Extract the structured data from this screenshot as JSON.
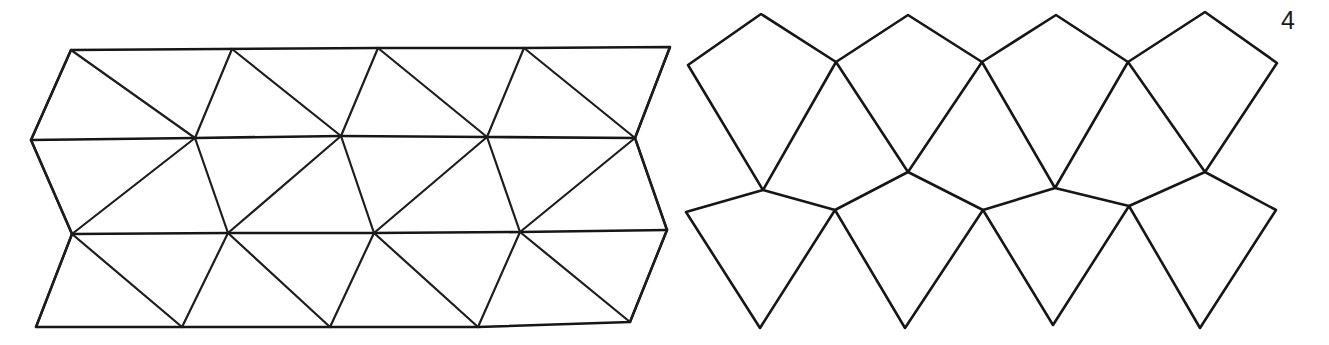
{
  "page": {
    "width": 1329,
    "height": 345,
    "background_color": "#ffffff",
    "figure_number": "4",
    "ink_color": "#161616"
  },
  "figures": [
    {
      "id": "left-net",
      "name": "triangulated-antiprism-net",
      "label": "",
      "face_type": "triangle",
      "bands": 3,
      "columns": 4,
      "bounds": {
        "x": 28,
        "y": 40,
        "width": 648,
        "height": 292
      },
      "outline_points": "71,50 378,48 524,48 670,47 635,138 667,230 630,322 478,327 330,327 182,327 36,327 72,234 31,140",
      "vertices": {
        "top_row": [
          [
            71,
            50
          ],
          [
            232,
            49
          ],
          [
            378,
            48
          ],
          [
            524,
            48
          ],
          [
            670,
            47
          ]
        ],
        "mid_upper_row": [
          [
            31,
            140
          ],
          [
            195,
            138
          ],
          [
            341,
            136
          ],
          [
            487,
            137
          ],
          [
            635,
            138
          ]
        ],
        "mid_lower_row": [
          [
            72,
            234
          ],
          [
            228,
            233
          ],
          [
            374,
            233
          ],
          [
            520,
            232
          ],
          [
            667,
            230
          ]
        ],
        "bottom_row": [
          [
            36,
            327
          ],
          [
            182,
            327
          ],
          [
            330,
            327
          ],
          [
            478,
            327
          ],
          [
            630,
            322
          ]
        ]
      },
      "edges_vertical": [
        "71,50 31,140",
        "232,49 195,138",
        "378,48 341,136",
        "524,48 487,137",
        "670,47 635,138",
        "31,140 72,234",
        "195,138 228,233",
        "341,136 374,233",
        "487,137 520,232",
        "635,138 667,230",
        "72,234 36,327",
        "228,233 182,327",
        "374,233 330,327",
        "520,232 478,327",
        "667,230 630,322"
      ],
      "edges_diagonal": [
        "71,50 195,138",
        "232,49 341,136",
        "378,48 487,137",
        "524,48 635,138",
        "195,138 72,234",
        "341,136 228,233",
        "487,137 374,233",
        "635,138 520,232",
        "72,234 182,327",
        "228,233 330,327",
        "374,233 478,327",
        "520,232 630,322"
      ]
    },
    {
      "id": "right-net",
      "name": "kite-trapezohedron-net",
      "label": "",
      "face_type": "kite",
      "rows": 2,
      "kites_per_row": 4,
      "bounds": {
        "x": 686,
        "y": 12,
        "width": 592,
        "height": 318
      },
      "upper_row_kites": [
        {
          "apex": [
            761,
            14
          ],
          "left": [
            688,
            65
          ],
          "right": [
            836,
            62
          ],
          "bottom": [
            763,
            190
          ]
        },
        {
          "apex": [
            908,
            15
          ],
          "left": [
            836,
            62
          ],
          "right": [
            982,
            62
          ],
          "bottom": [
            908,
            172
          ]
        },
        {
          "apex": [
            1056,
            15
          ],
          "left": [
            982,
            62
          ],
          "right": [
            1128,
            62
          ],
          "bottom": [
            1055,
            188
          ]
        },
        {
          "apex": [
            1205,
            12
          ],
          "left": [
            1128,
            62
          ],
          "right": [
            1277,
            63
          ],
          "bottom": [
            1205,
            172
          ]
        }
      ],
      "lower_row_kites": [
        {
          "top": [
            763,
            190
          ],
          "left": [
            686,
            212
          ],
          "right": [
            835,
            210
          ],
          "tip": [
            760,
            328
          ]
        },
        {
          "top": [
            908,
            172
          ],
          "left": [
            835,
            210
          ],
          "right": [
            983,
            210
          ],
          "tip": [
            905,
            328
          ]
        },
        {
          "top": [
            1055,
            188
          ],
          "left": [
            983,
            210
          ],
          "right": [
            1129,
            206
          ],
          "tip": [
            1053,
            325
          ]
        },
        {
          "top": [
            1205,
            172
          ],
          "left": [
            1129,
            206
          ],
          "right": [
            1276,
            210
          ],
          "tip": [
            1200,
            328
          ]
        }
      ]
    }
  ]
}
